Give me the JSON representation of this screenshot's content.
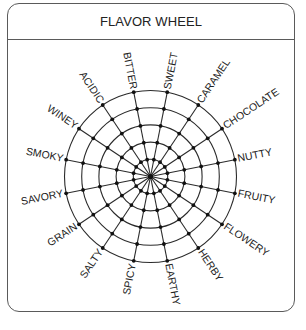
{
  "card": {
    "title": "FLAVOR WHEEL"
  },
  "wheel": {
    "center": [
      150.5,
      176.5
    ],
    "ring_count": 5,
    "outer_radius": 86,
    "spoke_count": 16,
    "line_color": "#2b2b2b",
    "dot_color": "#111111",
    "labels": [
      "NUTTY",
      "FRUITY",
      "FLOWERY",
      "HERBY",
      "EARTHY",
      "SPICY",
      "SALTY",
      "GRAIN",
      "SAVORY",
      "SMOKY",
      "WINEY",
      "ACIDIC",
      "BITTER",
      "SWEET",
      "CARAMEL",
      "CHOCOLATE"
    ]
  }
}
